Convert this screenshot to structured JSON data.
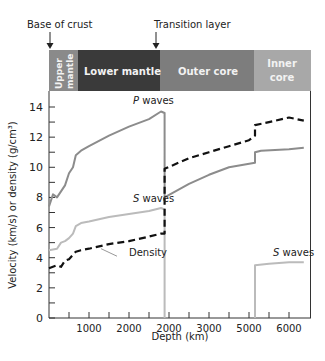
{
  "chart_data": {
    "type": "line",
    "title": "",
    "xlabel": "Depth (km)",
    "ylabel": "Velocity (km/s) or density (g/cm³)",
    "xlim": [
      0,
      6500
    ],
    "ylim": [
      0,
      15
    ],
    "grid": false,
    "x_tick_labels": [
      "1000",
      "2000",
      "2000",
      "3000",
      "5000",
      "6000"
    ],
    "y_tick_labels": [
      "0",
      "2",
      "4",
      "6",
      "8",
      "10",
      "12",
      "14"
    ],
    "annotations": [
      {
        "text": "Base of crust",
        "x": 0
      },
      {
        "text": "Transition layer",
        "x": 2890
      }
    ],
    "layers": [
      {
        "name": "Upper mantle",
        "from": 0,
        "to": 700,
        "color": "#8a8a8a"
      },
      {
        "name": "Lower mantle",
        "from": 700,
        "to": 2890,
        "color": "#3a3a3a"
      },
      {
        "name": "Outer core",
        "from": 2890,
        "to": 5150,
        "color": "#7d7d7d"
      },
      {
        "name": "Inner core",
        "from": 5150,
        "to": 6371,
        "color": "#a8a8a8"
      }
    ],
    "series": [
      {
        "name": "P waves",
        "style": "solid",
        "color": "#8c8c8c",
        "x": [
          0,
          100,
          200,
          300,
          400,
          500,
          600,
          670,
          800,
          1000,
          1500,
          2000,
          2500,
          2800,
          2890,
          2890,
          3500,
          4000,
          4500,
          5150,
          5150,
          5300,
          6000,
          6371
        ],
        "y": [
          7.4,
          8.2,
          8.0,
          8.4,
          8.8,
          9.6,
          10.0,
          10.8,
          11.1,
          11.4,
          12.1,
          12.7,
          13.2,
          13.7,
          13.6,
          8.0,
          8.9,
          9.5,
          10.0,
          10.3,
          11.0,
          11.1,
          11.2,
          11.3
        ]
      },
      {
        "name": "S waves",
        "style": "solid",
        "color": "#bbbbbb",
        "x": [
          0,
          200,
          300,
          400,
          500,
          600,
          670,
          800,
          1000,
          1500,
          2000,
          2500,
          2800,
          2890,
          2890
        ],
        "y": [
          4.5,
          4.6,
          5.0,
          5.1,
          5.3,
          5.6,
          6.1,
          6.3,
          6.4,
          6.7,
          6.9,
          7.1,
          7.3,
          7.2,
          0
        ]
      },
      {
        "name": "S waves (inner core)",
        "style": "solid",
        "color": "#bbbbbb",
        "x": [
          5150,
          5150,
          5500,
          6000,
          6371
        ],
        "y": [
          0,
          3.5,
          3.6,
          3.7,
          3.7
        ]
      },
      {
        "name": "Density",
        "style": "dashed",
        "color": "#111111",
        "x": [
          0,
          200,
          300,
          400,
          500,
          670,
          800,
          1000,
          1500,
          2000,
          2500,
          2800,
          2890,
          2890,
          3500,
          4000,
          4500,
          5000,
          5150,
          5150,
          5500,
          6000,
          6371
        ],
        "y": [
          3.3,
          3.5,
          3.4,
          3.8,
          3.9,
          4.4,
          4.5,
          4.6,
          4.9,
          5.1,
          5.4,
          5.6,
          5.6,
          9.9,
          10.6,
          11.0,
          11.4,
          11.8,
          12.1,
          12.8,
          13.0,
          13.3,
          13.1
        ]
      }
    ],
    "series_labels": [
      {
        "text": "P waves",
        "x": 2100,
        "y": 14.2
      },
      {
        "text": "S waves",
        "x": 2100,
        "y": 7.7
      },
      {
        "text": "Density",
        "x": 2000,
        "y": 4.1
      },
      {
        "text": "S waves",
        "x": 5600,
        "y": 4.1
      }
    ]
  },
  "axes": {
    "xlabel": "Depth (km)",
    "ylabel": "Velocity (km/s) or density (g/cm³)"
  },
  "header": {
    "base_of_crust": "Base of crust",
    "transition_layer": "Transition layer"
  },
  "bar": {
    "upper_mantle_1": "Upper",
    "upper_mantle_2": "mantle",
    "lower_mantle": "Lower mantle",
    "outer_core": "Outer core",
    "inner_core_1": "Inner",
    "inner_core_2": "core"
  }
}
